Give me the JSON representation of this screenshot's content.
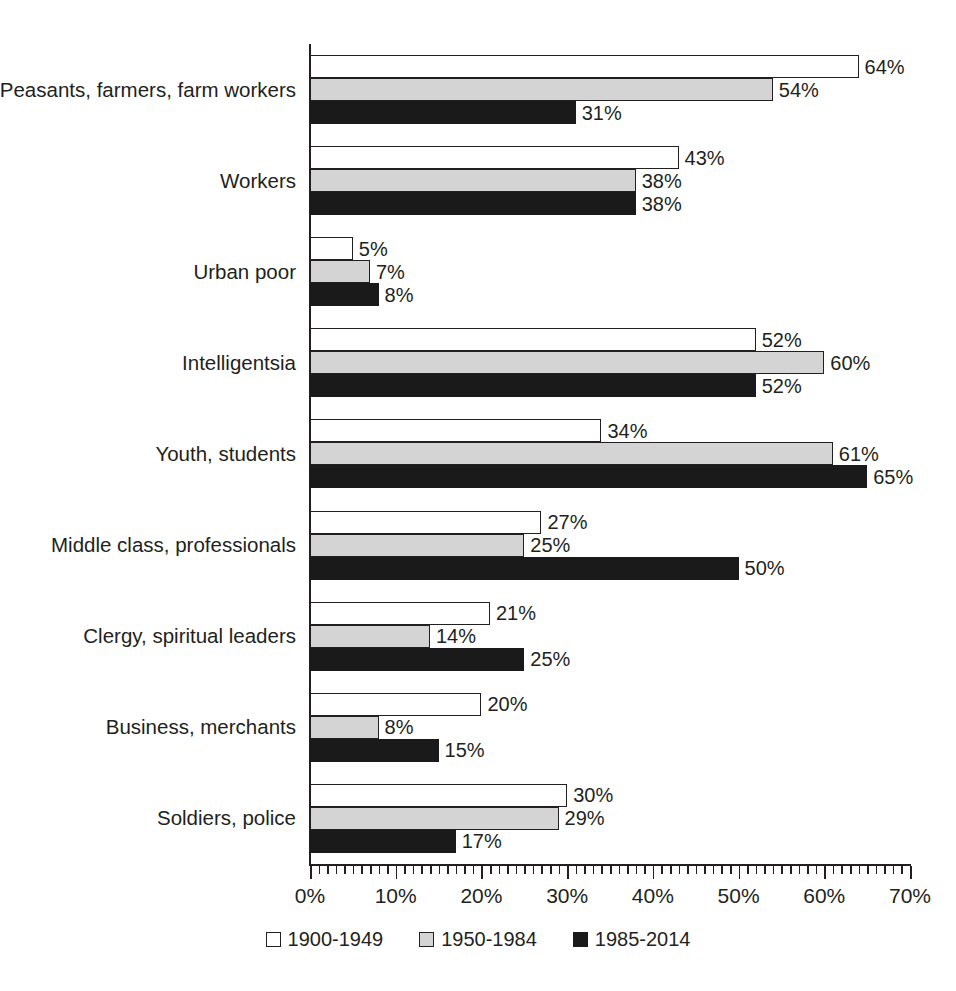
{
  "chart_data": {
    "type": "bar",
    "orientation": "horizontal",
    "title": "",
    "xlabel": "",
    "ylabel": "",
    "xlim": [
      0,
      70
    ],
    "xtick_labels": [
      "0%",
      "10%",
      "20%",
      "30%",
      "40%",
      "50%",
      "60%",
      "70%"
    ],
    "xticks": [
      0,
      10,
      20,
      30,
      40,
      50,
      60,
      70
    ],
    "minor_tick_step": 1,
    "grid": false,
    "legend_position": "bottom-center",
    "value_label_suffix": "%",
    "categories": [
      "Peasants, farmers, farm workers",
      "Workers",
      "Urban poor",
      "Intelligentsia",
      "Youth, students",
      "Middle class, professionals",
      "Clergy, spiritual leaders",
      "Business, merchants",
      "Soldiers, police"
    ],
    "series": [
      {
        "name": "1900-1949",
        "color": "#ffffff",
        "values": [
          64,
          43,
          5,
          52,
          34,
          27,
          21,
          20,
          30
        ],
        "labels": [
          "64%",
          "43%",
          "5%",
          "52%",
          "34%",
          "27%",
          "21%",
          "20%",
          "30%"
        ]
      },
      {
        "name": "1950-1984",
        "color": "#d4d4d4",
        "values": [
          54,
          38,
          7,
          60,
          61,
          25,
          14,
          8,
          29
        ],
        "labels": [
          "54%",
          "38%",
          "7%",
          "60%",
          "61%",
          "25%",
          "14%",
          "8%",
          "29%"
        ]
      },
      {
        "name": "1985-2014",
        "color": "#1a1a1a",
        "values": [
          31,
          38,
          8,
          52,
          65,
          50,
          25,
          15,
          17
        ],
        "labels": [
          "31%",
          "38%",
          "8%",
          "52%",
          "65%",
          "50%",
          "25%",
          "15%",
          "17%"
        ]
      }
    ]
  },
  "legend": {
    "items": [
      {
        "label": "1900-1949",
        "swatch": "white-square-icon"
      },
      {
        "label": "1950-1984",
        "swatch": "gray-square-icon"
      },
      {
        "label": "1985-2014",
        "swatch": "black-square-icon"
      }
    ]
  }
}
